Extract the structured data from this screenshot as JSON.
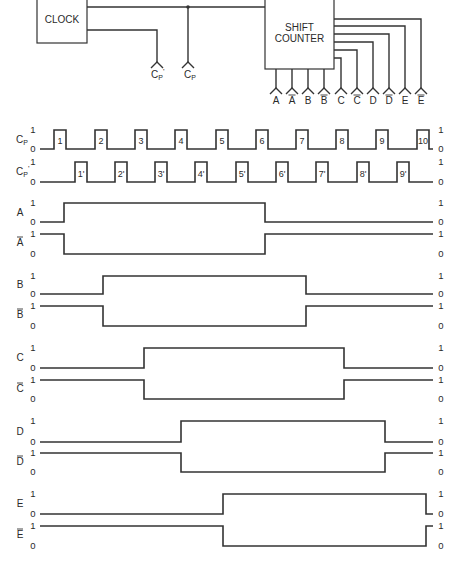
{
  "block_diagram": {
    "clock": {
      "label": "CLOCK",
      "x": 37,
      "y": -1,
      "w": 50,
      "h": 44
    },
    "shift_counter": {
      "label_line1": "SHIFT",
      "label_line2": "COUNTER",
      "x": 265,
      "y": -1,
      "w": 69,
      "h": 70
    },
    "clock_outputs": [
      {
        "name": "Cp",
        "label": "Cp",
        "sub": "P",
        "x": 188,
        "junction": true
      },
      {
        "name": "Cp_prime",
        "label": "Cp'",
        "sub": "P",
        "x": 157
      }
    ],
    "counter_outputs": [
      {
        "label": "A",
        "bar": false,
        "x": 276
      },
      {
        "label": "A",
        "bar": true,
        "x": 292
      },
      {
        "label": "B",
        "bar": false,
        "x": 308
      },
      {
        "label": "B",
        "bar": true,
        "x": 324
      },
      {
        "label": "C",
        "bar": false,
        "x": 341,
        "side_y": 58
      },
      {
        "label": "C",
        "bar": true,
        "x": 357,
        "side_y": 50
      },
      {
        "label": "D",
        "bar": false,
        "x": 373,
        "side_y": 42
      },
      {
        "label": "D",
        "bar": true,
        "x": 389,
        "side_y": 34
      },
      {
        "label": "E",
        "bar": false,
        "x": 405,
        "side_y": 26
      },
      {
        "label": "E",
        "bar": true,
        "x": 421,
        "side_y": 19
      }
    ]
  },
  "chart_data": {
    "type": "timing",
    "x_start": 40,
    "x_end": 433,
    "level_labels": {
      "high": "1",
      "low": "0"
    },
    "clock_pulses": {
      "Cp": {
        "label": "Cp",
        "high_y": 130,
        "low_y": 149,
        "pulse_width": 12,
        "rising_edges": [
          54,
          95,
          135,
          175,
          216,
          256,
          296,
          336,
          376,
          417
        ],
        "pulse_labels": [
          "1",
          "2",
          "3",
          "4",
          "5",
          "6",
          "7",
          "8",
          "9",
          "10"
        ]
      },
      "Cp_prime": {
        "label": "Cp'",
        "high_y": 162,
        "low_y": 182,
        "pulse_width": 12,
        "rising_edges": [
          75,
          115,
          155,
          195,
          236,
          276,
          316,
          357,
          397
        ],
        "pulse_labels": [
          "1'",
          "2'",
          "3'",
          "4'",
          "5'",
          "6'",
          "7'",
          "8'",
          "9'"
        ]
      }
    },
    "signals": [
      {
        "name": "A",
        "bar": false,
        "high_y": 203,
        "low_y": 222,
        "initial": 0,
        "rise_x": 64,
        "fall_x": 265,
        "high_period": [
          1,
          5
        ]
      },
      {
        "name": "A",
        "bar": true,
        "high_y": 234,
        "low_y": 254,
        "initial": 1,
        "fall_x": 64,
        "rise_x": 265
      },
      {
        "name": "B",
        "bar": false,
        "high_y": 276,
        "low_y": 294,
        "initial": 0,
        "rise_x": 103,
        "fall_x": 306,
        "high_period": [
          2,
          6
        ]
      },
      {
        "name": "B",
        "bar": true,
        "high_y": 306,
        "low_y": 326,
        "initial": 1,
        "fall_x": 103,
        "rise_x": 306
      },
      {
        "name": "C",
        "bar": false,
        "high_y": 348,
        "low_y": 368,
        "initial": 0,
        "rise_x": 144,
        "fall_x": 344,
        "high_period": [
          3,
          7
        ]
      },
      {
        "name": "C",
        "bar": true,
        "high_y": 380,
        "low_y": 399,
        "initial": 1,
        "fall_x": 144,
        "rise_x": 344
      },
      {
        "name": "D",
        "bar": false,
        "high_y": 421,
        "low_y": 442,
        "initial": 0,
        "rise_x": 181,
        "fall_x": 385,
        "high_period": [
          4,
          8
        ]
      },
      {
        "name": "D",
        "bar": true,
        "high_y": 453,
        "low_y": 472,
        "initial": 1,
        "fall_x": 181,
        "rise_x": 385
      },
      {
        "name": "E",
        "bar": false,
        "high_y": 494,
        "low_y": 514,
        "initial": 0,
        "rise_x": 223,
        "fall_x": 426,
        "high_period": [
          5,
          9
        ]
      },
      {
        "name": "E",
        "bar": true,
        "high_y": 526,
        "low_y": 546,
        "initial": 1,
        "fall_x": 223,
        "rise_x": 426
      }
    ]
  }
}
